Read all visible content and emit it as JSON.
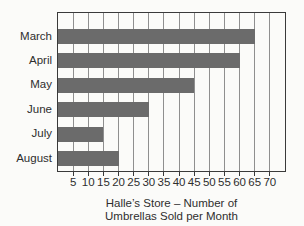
{
  "chart_data": {
    "type": "bar",
    "orientation": "horizontal",
    "title": "Halle’s Store – Number of Umbrellas Sold per Month",
    "caption_lines": [
      "Halle’s Store – Number of",
      "Umbrellas Sold per Month"
    ],
    "categories": [
      "March",
      "April",
      "May",
      "June",
      "July",
      "August"
    ],
    "values": [
      65,
      60,
      45,
      30,
      15,
      20
    ],
    "xlabel": "",
    "ylabel": "",
    "xlim": [
      0,
      75
    ],
    "xticks": [
      5,
      10,
      15,
      20,
      25,
      30,
      35,
      40,
      45,
      50,
      55,
      60,
      65,
      70
    ],
    "grid": "vertical",
    "legend": "none",
    "bar_color": "#6b6b6b",
    "border_color": "#3a3a3a",
    "gridline_color": "#8f8f8f",
    "text_color": "#2e2e2e",
    "background_color": "#fbfbf9"
  }
}
